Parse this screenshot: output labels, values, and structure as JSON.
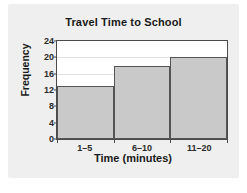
{
  "chart_data": {
    "type": "bar",
    "title": "Travel Time to School",
    "xlabel": "Time (minutes)",
    "ylabel": "Frequency",
    "categories": [
      "1–5",
      "6–10",
      "11–20"
    ],
    "values": [
      13,
      18,
      20
    ],
    "ylim": [
      0,
      24
    ],
    "yticks": [
      0,
      4,
      8,
      12,
      16,
      20,
      24
    ],
    "ytick_labels": [
      "0",
      "4",
      "8",
      "12",
      "16",
      "20",
      "24"
    ],
    "grid": true,
    "legend": null,
    "bar_color": "#c9c9c9",
    "bar_border_color": "#555555",
    "panel_color": "#efefef",
    "plot_background": "#ffffff",
    "text_color": "#1a1a1a"
  }
}
